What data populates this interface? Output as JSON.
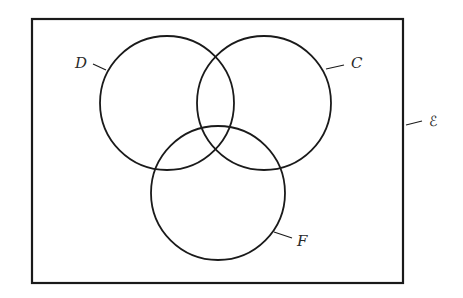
{
  "diagram": {
    "type": "venn",
    "universal_set": {
      "label": "ℰ"
    },
    "sets": [
      {
        "label": "D"
      },
      {
        "label": "C"
      },
      {
        "label": "F"
      }
    ],
    "stroke_color": "#1a1a1a"
  }
}
